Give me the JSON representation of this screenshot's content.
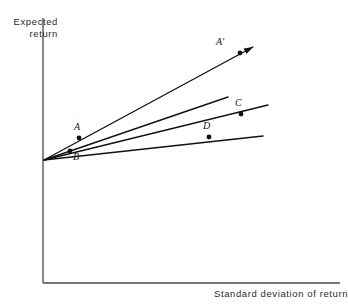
{
  "figure": {
    "title": "",
    "axes": {
      "y_label_line1": "Expected",
      "y_label_line2": "return",
      "x_label": "Standard deviation of return",
      "axis_color": "#4a4a4a",
      "y_axis": {
        "x": 43,
        "y_top": 18,
        "y_bottom": 283
      },
      "x_axis": {
        "y": 283,
        "x_left": 43,
        "x_right": 340
      }
    },
    "line_color": "#111111",
    "origin": {
      "x": 44,
      "y": 160
    },
    "rays": [
      {
        "name": "ray-a-prime",
        "x2": 253,
        "y2": 47,
        "arrow": true
      },
      {
        "name": "ray-second",
        "x2": 228,
        "y2": 97,
        "arrow": false
      },
      {
        "name": "ray-c",
        "x2": 268,
        "y2": 105,
        "arrow": false
      },
      {
        "name": "ray-d",
        "x2": 263,
        "y2": 136,
        "arrow": false
      }
    ],
    "points": [
      {
        "id": "A",
        "label": "A",
        "x": 79,
        "y": 138,
        "label_x": 74,
        "label_y": 121
      },
      {
        "id": "B",
        "label": "B",
        "x": 70,
        "y": 151,
        "label_x": 73,
        "label_y": 151
      },
      {
        "id": "Ap",
        "label": "A'",
        "x": 240,
        "y": 53,
        "label_x": 216,
        "label_y": 36
      },
      {
        "id": "C",
        "label": "C",
        "x": 241,
        "y": 114,
        "label_x": 235,
        "label_y": 97
      },
      {
        "id": "D",
        "label": "D",
        "x": 209,
        "y": 137,
        "label_x": 203,
        "label_y": 120
      }
    ]
  }
}
